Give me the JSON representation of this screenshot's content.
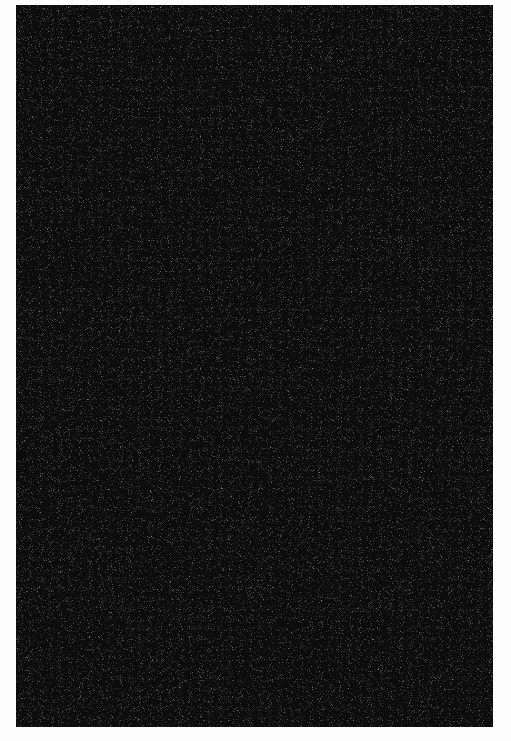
{
  "image": {
    "description": "Dark black speckled texture rectangle on white background",
    "colors": {
      "background": "#fdfdfd",
      "texture_base": "#0c0c0c",
      "speckle": "#8a8a8a"
    }
  }
}
